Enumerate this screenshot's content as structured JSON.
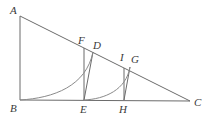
{
  "figure": {
    "width": 207,
    "height": 123,
    "background_color": "#ffffff",
    "stroke_color": "#6b6b6b",
    "label_color": "#3a3a3a"
  },
  "labels": {
    "A": "A",
    "B": "B",
    "C": "C",
    "D": "D",
    "E": "E",
    "F": "F",
    "G": "G",
    "H": "H",
    "I": "I"
  },
  "points": {
    "A": {
      "x": 20,
      "y": 16
    },
    "B": {
      "x": 20,
      "y": 100
    },
    "C": {
      "x": 190,
      "y": 101
    },
    "D": {
      "x": 93,
      "y": 52
    },
    "E": {
      "x": 84,
      "y": 100
    },
    "F": {
      "x": 84,
      "y": 48
    },
    "G": {
      "x": 130,
      "y": 67
    },
    "H": {
      "x": 124,
      "y": 100
    },
    "I": {
      "x": 124,
      "y": 68
    }
  },
  "label_positions": {
    "A": {
      "x": 10,
      "y": 5
    },
    "B": {
      "x": 10,
      "y": 103
    },
    "C": {
      "x": 194,
      "y": 97
    },
    "D": {
      "x": 93,
      "y": 40
    },
    "E": {
      "x": 80,
      "y": 104
    },
    "F": {
      "x": 78,
      "y": 35
    },
    "G": {
      "x": 131,
      "y": 54
    },
    "H": {
      "x": 119,
      "y": 104
    },
    "I": {
      "x": 120,
      "y": 52
    }
  },
  "segments": [
    {
      "name": "side-AB",
      "from": "A",
      "to": "B"
    },
    {
      "name": "side-BC",
      "from": "B",
      "to": "C"
    },
    {
      "name": "hypotenuse-AC",
      "from": "A",
      "to": "C"
    },
    {
      "name": "vertical-EF",
      "from": "E",
      "to": "F"
    },
    {
      "name": "vertical-HI",
      "from": "H",
      "to": "I"
    },
    {
      "name": "chord-ED",
      "from": "E",
      "to": "D"
    },
    {
      "name": "chord-HG",
      "from": "H",
      "to": "G"
    }
  ],
  "curves": [
    {
      "name": "arc-B-to-D",
      "start": "B",
      "end": "D",
      "control1": {
        "x": 54,
        "y": 98
      },
      "control2": {
        "x": 86,
        "y": 86
      }
    },
    {
      "name": "arc-E-to-G",
      "start": "E",
      "end": "G",
      "control1": {
        "x": 105,
        "y": 99
      },
      "control2": {
        "x": 126,
        "y": 90
      }
    }
  ]
}
